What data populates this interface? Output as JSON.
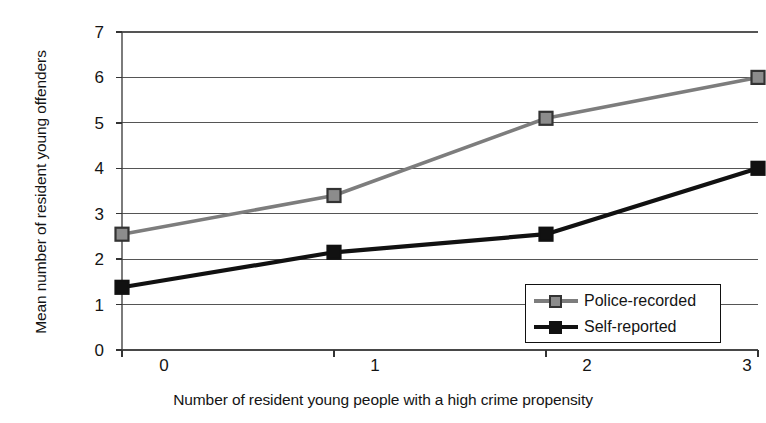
{
  "chart_data": {
    "type": "line",
    "title": "",
    "xlabel": "Number of resident young people with a high crime propensity",
    "ylabel": "Mean number of resident young offenders",
    "x": [
      0,
      1,
      2,
      3
    ],
    "categories": [
      "0",
      "1",
      "2",
      "3"
    ],
    "xtick_labels": [
      "0",
      "1",
      "2",
      "3"
    ],
    "ytick_labels": [
      "0",
      "1",
      "2",
      "3",
      "4",
      "5",
      "6",
      "7"
    ],
    "xlim": [
      0,
      3
    ],
    "ylim": [
      0,
      7
    ],
    "grid": "horizontal",
    "legend_position": "lower-right-inside",
    "series": [
      {
        "name": "Police-recorded",
        "color": "#7d7d7d",
        "marker": "square",
        "marker_fill": "#8c8c8c",
        "marker_edge": "#333333",
        "values": [
          2.55,
          3.4,
          5.1,
          6.0
        ]
      },
      {
        "name": "Self-reported",
        "color": "#111111",
        "marker": "square",
        "marker_fill": "#111111",
        "marker_edge": "#111111",
        "values": [
          1.38,
          2.15,
          2.55,
          4.0
        ]
      }
    ]
  },
  "legend": {
    "entries": [
      {
        "label": "Police-recorded"
      },
      {
        "label": "Self-reported"
      }
    ]
  },
  "axes": {
    "y_title": "Mean number of resident young offenders",
    "x_title": "Number of resident young people with a high crime propensity",
    "y_ticks": [
      "7",
      "6",
      "5",
      "4",
      "3",
      "2",
      "1",
      "0"
    ],
    "x_ticks": [
      "0",
      "1",
      "2",
      "3"
    ]
  },
  "colors": {
    "police_recorded": "#7d7d7d",
    "self_reported": "#111111",
    "gridline": "#555555",
    "axis": "#333333",
    "background": "#ffffff"
  }
}
